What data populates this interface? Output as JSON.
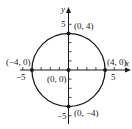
{
  "diagram": {
    "type": "circle-on-coordinate-plane",
    "axes": {
      "x_label": "x",
      "y_label": "y",
      "x_ticks": {
        "neg_label": "-5",
        "pos_label": "5"
      },
      "y_ticks": {
        "pos_label": "5",
        "neg_label": "-5"
      }
    },
    "circle": {
      "center": "(0, 0)",
      "radius": 4
    },
    "points": [
      {
        "label": "(0, 4)",
        "x": 0,
        "y": 4
      },
      {
        "label": "(4, 0)",
        "x": 4,
        "y": 0
      },
      {
        "label": "(0, -4)",
        "x": 0,
        "y": -4
      },
      {
        "label": "(-4, 0)",
        "x": -4,
        "y": 0
      },
      {
        "label": "(0, 0)",
        "x": 0,
        "y": 0
      }
    ]
  },
  "labels": {
    "x_axis": "x",
    "y_axis": "y",
    "x_neg5": "−5",
    "x_pos5": "5",
    "y_pos5": "5",
    "y_neg5": "−5",
    "pt_top": "(0, 4)",
    "pt_right": "(4, 0)",
    "pt_bottom": "(0, −4)",
    "pt_left": "(−4, 0)",
    "pt_origin": "(0, 0)"
  },
  "colors": {
    "ink": "#1a1a1a",
    "background": "#ffffff"
  }
}
